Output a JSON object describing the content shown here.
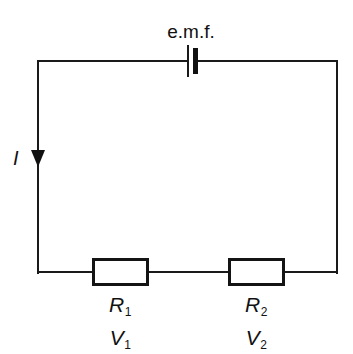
{
  "diagram": {
    "background_color": "#ffffff",
    "line_color": "#111111",
    "source": {
      "label": "e.m.f.",
      "symbol_name": "battery-cell-symbol"
    },
    "current": {
      "label": "I",
      "direction": "down",
      "arrow_name": "current-direction-arrow"
    },
    "components": [
      {
        "resistance_label": "R",
        "resistance_subscript": "1",
        "voltage_label": "V",
        "voltage_subscript": "1"
      },
      {
        "resistance_label": "R",
        "resistance_subscript": "2",
        "voltage_label": "V",
        "voltage_subscript": "2"
      }
    ]
  }
}
